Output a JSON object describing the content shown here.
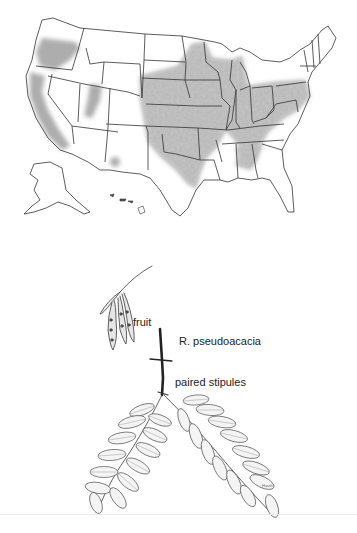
{
  "figure": {
    "map": {
      "subject": "distribution-map-contiguous-us-alaska-hawaii",
      "shading_color": "#a9a9a9",
      "border_color": "#333333"
    },
    "illustration": {
      "species_label": "R. pseudoacacia",
      "callouts": [
        {
          "id": "fruit",
          "text": "fruit"
        },
        {
          "id": "stipules",
          "text": "paired stipules"
        }
      ],
      "artist_signature": "Hauth"
    }
  }
}
